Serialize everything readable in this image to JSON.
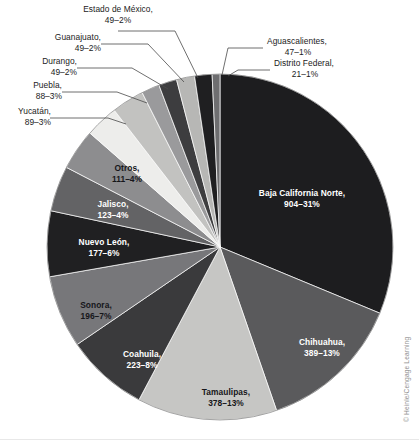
{
  "credit": "© Heinle/Cengage Learning",
  "chart_data": {
    "type": "pie",
    "title": "",
    "subtitle": "",
    "xlabel": "",
    "ylabel": "",
    "legend_position": "none",
    "grid": false,
    "total": 2893,
    "label_format": "{name}, {value}-{percent}%",
    "start_angle_deg": 0,
    "direction": "clockwise",
    "categories": [
      "Baja California Norte",
      "Chihuahua",
      "Tamaulipas",
      "Coahuila",
      "Sonora",
      "Nuevo León",
      "Jalisco",
      "Otros",
      "Yucatán",
      "Puebla",
      "Durango",
      "Guanajuato",
      "Estado de México",
      "Aguascalientes",
      "Distrito Federal"
    ],
    "values": [
      904,
      389,
      378,
      223,
      196,
      177,
      123,
      111,
      89,
      88,
      49,
      49,
      49,
      47,
      21
    ],
    "percents": [
      31,
      13,
      13,
      8,
      7,
      6,
      4,
      4,
      3,
      3,
      2,
      2,
      2,
      1,
      1
    ],
    "colors": [
      "#1d1d1f",
      "#5a5a5c",
      "#c6c6c4",
      "#3a3a3c",
      "#77777a",
      "#202022",
      "#636365",
      "#8d8d8f",
      "#ededeb",
      "#c2c2c0",
      "#9a9a9c",
      "#3d3d3f",
      "#b7b7b5",
      "#1f1f21",
      "#6e6e70"
    ],
    "slices": [
      {
        "name": "Baja California Norte",
        "value": 904,
        "percent": 31,
        "label_line1": "Baja California Norte,",
        "label_line2": "904–31%",
        "label_placement": "inside",
        "label_color": "light",
        "color": "#1d1d1f"
      },
      {
        "name": "Chihuahua",
        "value": 389,
        "percent": 13,
        "label_line1": "Chihuahua,",
        "label_line2": "389–13%",
        "label_placement": "inside",
        "label_color": "light",
        "color": "#5a5a5c"
      },
      {
        "name": "Tamaulipas",
        "value": 378,
        "percent": 13,
        "label_line1": "Tamaulipas,",
        "label_line2": "378–13%",
        "label_placement": "inside",
        "label_color": "dark",
        "color": "#c6c6c4"
      },
      {
        "name": "Coahuila",
        "value": 223,
        "percent": 8,
        "label_line1": "Coahuila,",
        "label_line2": "223–8%",
        "label_placement": "inside",
        "label_color": "light",
        "color": "#3a3a3c"
      },
      {
        "name": "Sonora",
        "value": 196,
        "percent": 7,
        "label_line1": "Sonora,",
        "label_line2": "196–7%",
        "label_placement": "inside",
        "label_color": "dark",
        "color": "#77777a"
      },
      {
        "name": "Nuevo León",
        "value": 177,
        "percent": 6,
        "label_line1": "Nuevo León,",
        "label_line2": "177–6%",
        "label_placement": "inside",
        "label_color": "light",
        "color": "#202022"
      },
      {
        "name": "Jalisco",
        "value": 123,
        "percent": 4,
        "label_line1": "Jalisco,",
        "label_line2": "123–4%",
        "label_placement": "inside",
        "label_color": "light",
        "color": "#636365"
      },
      {
        "name": "Otros",
        "value": 111,
        "percent": 4,
        "label_line1": "Otros,",
        "label_line2": "111–4%",
        "label_placement": "inside",
        "label_color": "dark",
        "color": "#8d8d8f"
      },
      {
        "name": "Yucatán",
        "value": 89,
        "percent": 3,
        "label_line1": "Yucatán,",
        "label_line2": "89–3%",
        "label_placement": "callout",
        "label_color": "dark",
        "color": "#ededeb"
      },
      {
        "name": "Puebla",
        "value": 88,
        "percent": 3,
        "label_line1": "Puebla,",
        "label_line2": "88–3%",
        "label_placement": "callout",
        "label_color": "dark",
        "color": "#c2c2c0"
      },
      {
        "name": "Durango",
        "value": 49,
        "percent": 2,
        "label_line1": "Durango,",
        "label_line2": "49–2%",
        "label_placement": "callout",
        "label_color": "dark",
        "color": "#9a9a9c"
      },
      {
        "name": "Guanajuato",
        "value": 49,
        "percent": 2,
        "label_line1": "Guanajuato,",
        "label_line2": "49–2%",
        "label_placement": "callout",
        "label_color": "dark",
        "color": "#3d3d3f"
      },
      {
        "name": "Estado de México",
        "value": 49,
        "percent": 2,
        "label_line1": "Estado de México,",
        "label_line2": "49–2%",
        "label_placement": "callout",
        "label_color": "dark",
        "color": "#b7b7b5"
      },
      {
        "name": "Aguascalientes",
        "value": 47,
        "percent": 1,
        "label_line1": "Aguascalientes,",
        "label_line2": "47–1%",
        "label_placement": "callout",
        "label_color": "dark",
        "color": "#1f1f21"
      },
      {
        "name": "Distrito Federal",
        "value": 21,
        "percent": 1,
        "label_line1": "Distrito Federal,",
        "label_line2": "21–1%",
        "label_placement": "callout",
        "label_color": "dark",
        "color": "#6e6e70"
      }
    ]
  }
}
